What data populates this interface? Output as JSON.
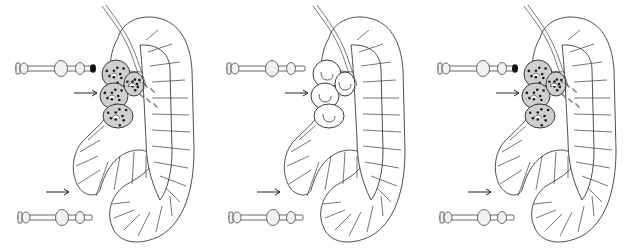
{
  "figure": {
    "colors": {
      "line": "#3a3a3a",
      "shade": "#5a5a5a",
      "nucleus": "#1a1a1a",
      "background": "#ffffff"
    },
    "panels": [
      {
        "id": "left",
        "cluster_state": "dense-shaded",
        "top_rod_cap": "dark",
        "dispersed_particles": true
      },
      {
        "id": "middle",
        "cluster_state": "empty-lobes",
        "top_rod_cap": "none",
        "dispersed_particles": false
      },
      {
        "id": "right",
        "cluster_state": "dense-shaded",
        "top_rod_cap": "dark",
        "dispersed_particles": true
      }
    ]
  }
}
